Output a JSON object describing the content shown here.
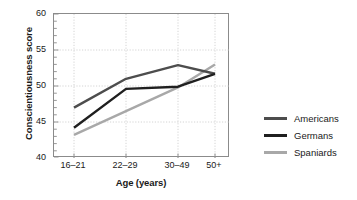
{
  "chart_data": {
    "type": "line",
    "title": "",
    "xlabel": "Age (years)",
    "ylabel": "Conscientiousness score",
    "categories": [
      "16–21",
      "22–29",
      "30–49",
      "50+"
    ],
    "ylim": [
      40,
      60
    ],
    "yticks": [
      40,
      45,
      50,
      55,
      60
    ],
    "ytick_labels": [
      "40",
      "45",
      "50",
      "55",
      "60"
    ],
    "minor_ticks_per_interval": 5,
    "grid": true,
    "grid_style": "dotted",
    "legend_position": "right",
    "series": [
      {
        "name": "Americans",
        "color": "#4d4d4d",
        "values": [
          47.0,
          51.0,
          52.9,
          51.7
        ]
      },
      {
        "name": "Germans",
        "color": "#1f1f1f",
        "values": [
          44.2,
          49.6,
          49.9,
          51.7
        ]
      },
      {
        "name": "Spaniards",
        "color": "#a8a8a8",
        "values": [
          43.2,
          46.5,
          49.8,
          53.0
        ]
      }
    ]
  },
  "legend": {
    "items": [
      {
        "label": "Americans",
        "color": "#4d4d4d"
      },
      {
        "label": "Germans",
        "color": "#1f1f1f"
      },
      {
        "label": "Spaniards",
        "color": "#a8a8a8"
      }
    ]
  },
  "axes": {
    "y_title": "Conscientiousness score",
    "x_title": "Age (years)",
    "y_tick_labels": [
      "60",
      "55",
      "50",
      "45",
      "40"
    ],
    "x_tick_labels": [
      "16–21",
      "22–29",
      "30–49",
      "50+"
    ]
  },
  "colors": {
    "frame": "#8b8b8b",
    "grid": "#c9c9c9",
    "text": "#1a1a1a",
    "background": "#ffffff"
  }
}
